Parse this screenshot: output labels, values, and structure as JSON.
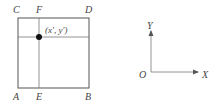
{
  "diagram": {
    "square": {
      "corners": {
        "top_left": "C",
        "top_right": "D",
        "bottom_left": "A",
        "bottom_right": "B"
      },
      "divider_points": {
        "top": "F",
        "bottom": "E"
      },
      "point_label": "(x′, y′)"
    },
    "axes": {
      "origin": "O",
      "x_axis": "X",
      "y_axis": "Y"
    },
    "colors": {
      "line": "#555555",
      "axis": "#888888",
      "dot": "#111111",
      "text": "#444444"
    }
  }
}
